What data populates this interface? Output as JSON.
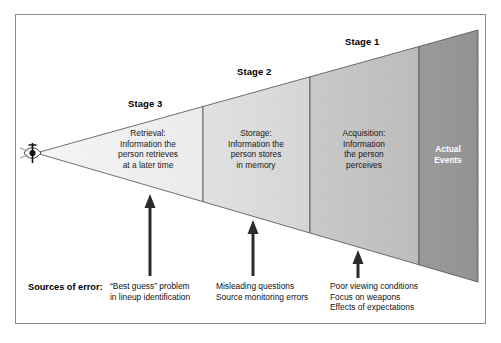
{
  "figure": {
    "frame_color": "#8c8c8c",
    "background": "#ffffff"
  },
  "eye": {
    "icon": "eye-icon",
    "description": "Eye at apex of funnel"
  },
  "stages": [
    {
      "id": "stage-3",
      "stage_label": "Stage 3",
      "panel_title": "Retrieval:",
      "panel_body": "Retrieval:\nInformation the\nperson retrieves\nat a later time",
      "fill": "#f0f0f0",
      "text_color": "#1a1a1a"
    },
    {
      "id": "stage-2",
      "stage_label": "Stage 2",
      "panel_title": "Storage:",
      "panel_body": "Storage:\nInformation the\nperson stores\nin memory",
      "fill": "#dcdcdc",
      "text_color": "#1a1a1a"
    },
    {
      "id": "stage-1",
      "stage_label": "Stage 1",
      "panel_title": "Acquisition:",
      "panel_body": "Acquisition:\nInformation\nthe person\nperceives",
      "fill": "#c3c3c3",
      "text_color": "#1a1a1a"
    },
    {
      "id": "actual-events",
      "stage_label": "",
      "panel_title": "Actual Events",
      "panel_body": "Actual\nEvents",
      "fill": "#969696",
      "text_color": "#ffffff"
    }
  ],
  "sources": {
    "label": "Sources of error:",
    "columns": [
      {
        "id": "sources-stage-3",
        "text": "“Best guess” problem\nin lineup identification"
      },
      {
        "id": "sources-stage-2",
        "text": "Misleading questions\nSource monitoring errors"
      },
      {
        "id": "sources-stage-1",
        "text": "Poor viewing conditions\nFocus on weapons\nEffects of expectations"
      }
    ]
  },
  "arrows": [
    {
      "id": "arrow-stage-3",
      "direction": "up"
    },
    {
      "id": "arrow-stage-2",
      "direction": "up"
    },
    {
      "id": "arrow-stage-1",
      "direction": "up"
    }
  ]
}
